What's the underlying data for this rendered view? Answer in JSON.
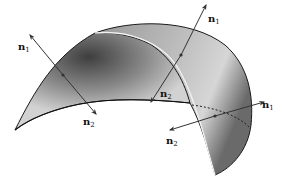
{
  "diagram": {
    "colors": {
      "surface_light": "#d0d0d0",
      "surface_dark": "#4a4a4a",
      "edge": "#1a1a1a",
      "arrow": "#333333",
      "seam": "#f2f2f2"
    },
    "normals": [
      {
        "id": "left",
        "labels": {
          "n1": {
            "base": "n",
            "sub": "1"
          },
          "n2": {
            "base": "n",
            "sub": "2"
          }
        }
      },
      {
        "id": "middle",
        "labels": {
          "n1": {
            "base": "n",
            "sub": "1"
          },
          "n2": {
            "base": "n",
            "sub": "2"
          }
        }
      },
      {
        "id": "right",
        "labels": {
          "n1": {
            "base": "n",
            "sub": "1"
          },
          "n2": {
            "base": "n",
            "sub": "2"
          }
        }
      }
    ]
  }
}
